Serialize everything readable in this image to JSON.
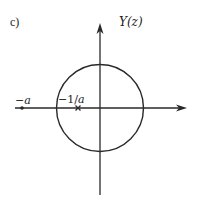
{
  "figure": {
    "panel_label": "c)",
    "y_axis_label": "Y(z)",
    "points": [
      {
        "label_sign": "−",
        "label_var": "a",
        "x": 22,
        "y": 108
      },
      {
        "label_sign": "−1/",
        "label_var": "a",
        "x": 78,
        "y": 108
      }
    ],
    "circle": {
      "cx": 100,
      "cy": 108,
      "r": 43.5
    },
    "axes": {
      "origin_x": 100,
      "origin_y": 108,
      "x_start": 15,
      "x_end": 187,
      "y_top": 24,
      "y_bottom": 195
    },
    "colors": {
      "stroke": "#2a2a2a",
      "background": "#ffffff"
    }
  }
}
